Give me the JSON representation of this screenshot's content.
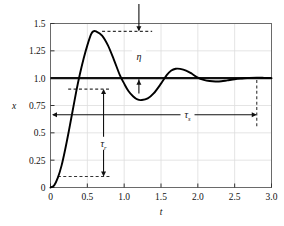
{
  "chart_data": {
    "type": "line",
    "title": "",
    "xlabel": "t",
    "ylabel": "x",
    "xlim": [
      0,
      3.0
    ],
    "ylim": [
      0,
      1.5
    ],
    "grid": true,
    "legend": null,
    "xticks": [
      "0",
      "0.5",
      "1.0",
      "1.5",
      "2.0",
      "2.5",
      "3.0"
    ],
    "xtick_values": [
      0,
      0.5,
      1.0,
      1.5,
      2.0,
      2.5,
      3.0
    ],
    "yticks": [
      "0",
      "0.25",
      "0.5",
      "0.75",
      "1.0",
      "1.25",
      "1.5"
    ],
    "ytick_values": [
      0,
      0.25,
      0.5,
      0.75,
      1.0,
      1.25,
      1.5
    ],
    "series": [
      {
        "name": "step-response",
        "x": [
          0.0,
          0.05,
          0.1,
          0.15,
          0.2,
          0.25,
          0.3,
          0.35,
          0.4,
          0.45,
          0.5,
          0.55,
          0.58,
          0.62,
          0.7,
          0.78,
          0.86,
          0.94,
          1.0,
          1.06,
          1.12,
          1.18,
          1.24,
          1.32,
          1.4,
          1.5,
          1.58,
          1.64,
          1.7,
          1.76,
          1.84,
          1.92,
          2.0,
          2.08,
          2.16,
          2.24,
          2.32,
          2.4,
          2.5,
          2.6,
          2.7,
          2.8,
          2.9,
          3.0
        ],
        "y": [
          0.0,
          0.02,
          0.09,
          0.2,
          0.35,
          0.52,
          0.7,
          0.88,
          1.04,
          1.18,
          1.3,
          1.4,
          1.428,
          1.427,
          1.39,
          1.3,
          1.17,
          1.03,
          0.95,
          0.88,
          0.835,
          0.805,
          0.8,
          0.815,
          0.86,
          0.95,
          1.03,
          1.07,
          1.086,
          1.085,
          1.07,
          1.04,
          1.005,
          0.985,
          0.974,
          0.97,
          0.972,
          0.98,
          0.99,
          0.997,
          1.003,
          1.005,
          1.003,
          1.0
        ]
      }
    ],
    "reference_line": {
      "name": "steady-state",
      "y": 1.0
    },
    "annotations": [
      {
        "name": "overshoot",
        "label": "η",
        "subscript": "",
        "x": 1.2,
        "y": 1.2
      },
      {
        "name": "rise-time",
        "label": "τ",
        "subscript": "r",
        "x": 0.72,
        "y": 0.4
      },
      {
        "name": "settling-time",
        "label": "τ",
        "subscript": "s",
        "x": 1.86,
        "y": 0.665
      }
    ],
    "guides": {
      "peak_dashed_y": 1.428,
      "peak_dashed_x_from": 0.7,
      "peak_dashed_x_to": 1.38,
      "rise_upper_dashed_y": 0.9,
      "rise_upper_dashed_x_from": 0.24,
      "rise_upper_dashed_x_to": 0.8,
      "rise_lower_dashed_y": 0.1,
      "rise_lower_dashed_x_from": 0.1,
      "rise_lower_dashed_x_to": 0.8,
      "settling_dashed_x": 2.8,
      "settling_dashed_y_from": 0.56,
      "settling_dashed_y_to": 1.0,
      "overshoot_top_arrow_x": 1.2,
      "rise_arrow_x": 0.72,
      "settling_arrow_y": 0.665,
      "settling_arrow_x_from": 0.02,
      "settling_arrow_x_to": 2.8
    },
    "colors": {
      "curve": "#000000",
      "frame": "#555555",
      "grid": "#dddddd",
      "reference": "#111111",
      "dashed": "#333333",
      "text": "#111111"
    }
  }
}
